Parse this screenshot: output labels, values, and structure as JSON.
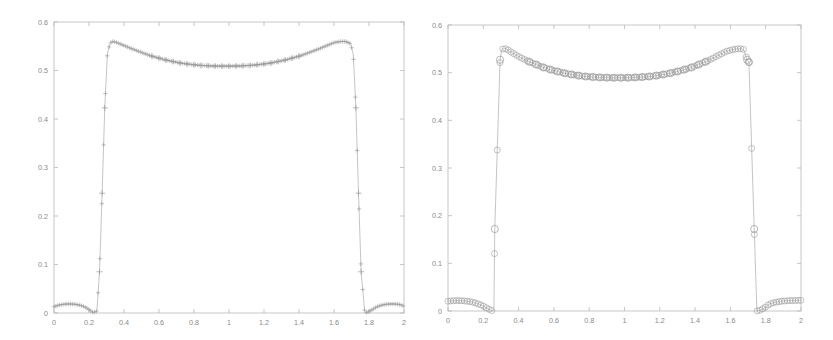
{
  "figure": {
    "background": "#ffffff",
    "axis_color": "#b9b9b9",
    "line_color": "#aaaaaa",
    "marker_color": "#9a9a9a",
    "tick_text_color": "#8a8a8a",
    "panel_count": 2
  },
  "chart_data": [
    {
      "type": "line",
      "title": "",
      "subtitle": "",
      "xlabel": "",
      "ylabel": "",
      "xlim": [
        0,
        2
      ],
      "ylim": [
        0,
        0.6
      ],
      "xticks": [
        0,
        0.2,
        0.4,
        0.6,
        0.8,
        1,
        1.2,
        1.4,
        1.6,
        1.8,
        2
      ],
      "xticklabels": [
        "0",
        "0.2",
        "0.4",
        "0.6",
        "0.8",
        "1",
        "1.2",
        "1.4",
        "1.6",
        "1.8",
        "2"
      ],
      "yticks": [
        0,
        0.1,
        0.2,
        0.3,
        0.4,
        0.5,
        0.6
      ],
      "yticklabels": [
        "0",
        "0.1",
        "0.2",
        "0.3",
        "0.4",
        "0.5",
        "0.6"
      ],
      "grid": false,
      "legend": null,
      "marker": "plus",
      "marker_size": 2.2,
      "linestyle": "solid",
      "series": [
        {
          "name": "solution-left",
          "x": [
            0.0,
            0.02,
            0.04,
            0.06,
            0.08,
            0.1,
            0.12,
            0.14,
            0.16,
            0.18,
            0.2,
            0.215,
            0.225,
            0.245,
            0.26,
            0.275,
            0.29,
            0.305,
            0.32,
            0.335,
            0.36,
            0.4,
            0.44,
            0.48,
            0.52,
            0.56,
            0.6,
            0.64,
            0.68,
            0.72,
            0.76,
            0.8,
            0.84,
            0.88,
            0.92,
            0.96,
            1.0,
            1.04,
            1.08,
            1.12,
            1.16,
            1.2,
            1.24,
            1.28,
            1.32,
            1.36,
            1.4,
            1.44,
            1.48,
            1.52,
            1.56,
            1.6,
            1.64,
            1.665,
            1.695,
            1.71,
            1.725,
            1.74,
            1.755,
            1.775,
            1.785,
            1.8,
            1.82,
            1.84,
            1.86,
            1.88,
            1.9,
            1.92,
            1.94,
            1.96,
            1.98,
            2.0
          ],
          "y": [
            0.013,
            0.0155,
            0.0172,
            0.0182,
            0.0186,
            0.0185,
            0.018,
            0.0168,
            0.0148,
            0.0118,
            0.0072,
            0.0032,
            0.0008,
            0.004,
            0.085,
            0.247,
            0.423,
            0.534,
            0.556,
            0.56,
            0.5575,
            0.5515,
            0.5455,
            0.54,
            0.5345,
            0.5295,
            0.5255,
            0.5215,
            0.5185,
            0.5155,
            0.5135,
            0.5118,
            0.5105,
            0.5098,
            0.5092,
            0.509,
            0.509,
            0.5092,
            0.5098,
            0.5105,
            0.5118,
            0.5135,
            0.5155,
            0.5185,
            0.5215,
            0.5255,
            0.5295,
            0.5345,
            0.54,
            0.5455,
            0.5515,
            0.5575,
            0.5598,
            0.56,
            0.5555,
            0.534,
            0.423,
            0.247,
            0.085,
            0.004,
            0.0008,
            0.0032,
            0.0072,
            0.0118,
            0.0148,
            0.0168,
            0.018,
            0.0185,
            0.0186,
            0.0182,
            0.0172,
            0.014
          ]
        }
      ]
    },
    {
      "type": "line",
      "title": "",
      "subtitle": "",
      "xlabel": "",
      "ylabel": "",
      "xlim": [
        0,
        2
      ],
      "ylim": [
        0,
        0.6
      ],
      "xticks": [
        0,
        0.2,
        0.4,
        0.6,
        0.8,
        1,
        1.2,
        1.4,
        1.6,
        1.8,
        2
      ],
      "xticklabels": [
        "0",
        "0.2",
        "0.4",
        "0.6",
        "0.8",
        "1",
        "1.2",
        "1.4",
        "1.6",
        "1.8",
        "2"
      ],
      "yticks": [
        0,
        0.1,
        0.2,
        0.3,
        0.4,
        0.5,
        0.6
      ],
      "yticklabels": [
        "0",
        "0.1",
        "0.2",
        "0.3",
        "0.4",
        "0.5",
        "0.6"
      ],
      "grid": false,
      "legend": null,
      "marker": "circle",
      "marker_size": 3.0,
      "linestyle": "solid",
      "series": [
        {
          "name": "solution-right",
          "x": [
            0.0,
            0.025,
            0.05,
            0.075,
            0.1,
            0.125,
            0.15,
            0.175,
            0.2,
            0.215,
            0.23,
            0.245,
            0.26,
            0.265,
            0.295,
            0.305,
            0.32,
            0.335,
            0.35,
            0.38,
            0.42,
            0.46,
            0.5,
            0.54,
            0.58,
            0.62,
            0.66,
            0.7,
            0.74,
            0.78,
            0.82,
            0.86,
            0.9,
            0.94,
            0.98,
            1.02,
            1.06,
            1.1,
            1.14,
            1.18,
            1.22,
            1.26,
            1.3,
            1.34,
            1.38,
            1.42,
            1.46,
            1.5,
            1.54,
            1.58,
            1.62,
            1.655,
            1.675,
            1.695,
            1.705,
            1.735,
            1.75,
            1.765,
            1.78,
            1.795,
            1.82,
            1.85,
            1.88,
            1.91,
            1.94,
            1.97,
            2.0
          ],
          "y": [
            0.0205,
            0.0215,
            0.0218,
            0.0216,
            0.0208,
            0.0196,
            0.0175,
            0.0145,
            0.0105,
            0.0072,
            0.004,
            0.0012,
            0.0002,
            0.172,
            0.527,
            0.549,
            0.551,
            0.549,
            0.545,
            0.538,
            0.53,
            0.523,
            0.517,
            0.511,
            0.5065,
            0.5025,
            0.499,
            0.4962,
            0.4938,
            0.492,
            0.4908,
            0.49,
            0.4895,
            0.4893,
            0.4893,
            0.4895,
            0.49,
            0.4908,
            0.492,
            0.4938,
            0.4962,
            0.499,
            0.5025,
            0.5065,
            0.511,
            0.517,
            0.523,
            0.53,
            0.538,
            0.545,
            0.549,
            0.5505,
            0.549,
            0.527,
            0.522,
            0.172,
            0.0002,
            0.0012,
            0.004,
            0.0072,
            0.0145,
            0.018,
            0.02,
            0.0212,
            0.0218,
            0.022,
            0.0225
          ]
        }
      ]
    }
  ]
}
